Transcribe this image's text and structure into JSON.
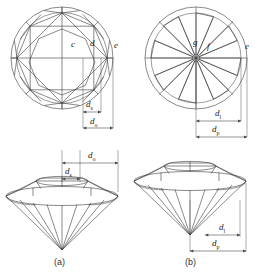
{
  "figure": {
    "background_color": "#ffffff",
    "line_color": "#3a3a3a",
    "dimension_line_color": "#4a4a4a",
    "panels": [
      {
        "id": "a",
        "caption": "(a)",
        "top_view": {
          "name": "crown-view",
          "facet_labels": [
            {
              "text": "c",
              "x": 75,
              "y": 47
            },
            {
              "text": "d",
              "x": 94,
              "y": 46
            },
            {
              "text": "e",
              "x": 116,
              "y": 48
            }
          ],
          "dimensions": [
            {
              "symbol": "d",
              "subscript": "s",
              "x": 92,
              "y": 105
            },
            {
              "symbol": "d",
              "subscript": "o",
              "x": 96,
              "y": 122
            }
          ]
        },
        "side_view": {
          "name": "profile-view",
          "dimensions": [
            {
              "symbol": "d",
              "subscript": "o",
              "x": 97,
              "y": 155
            },
            {
              "symbol": "d",
              "subscript": "s",
              "x": 88,
              "y": 172
            }
          ]
        }
      },
      {
        "id": "b",
        "caption": "(b)",
        "top_view": {
          "name": "pavilion-view",
          "facet_labels": [
            {
              "text": "g",
              "x": 196,
              "y": 45
            },
            {
              "text": "f",
              "x": 210,
              "y": 48
            },
            {
              "text": "e",
              "x": 247,
              "y": 49
            }
          ],
          "dimensions": [
            {
              "symbol": "d",
              "subscript": "l",
              "x": 222,
              "y": 113
            },
            {
              "symbol": "d",
              "subscript": "p",
              "x": 218,
              "y": 128
            }
          ]
        },
        "side_view": {
          "name": "profile-view",
          "dimensions": [
            {
              "symbol": "d",
              "subscript": "l",
              "x": 227,
              "y": 228
            },
            {
              "symbol": "d",
              "subscript": "p",
              "x": 220,
              "y": 245
            }
          ]
        }
      }
    ]
  }
}
